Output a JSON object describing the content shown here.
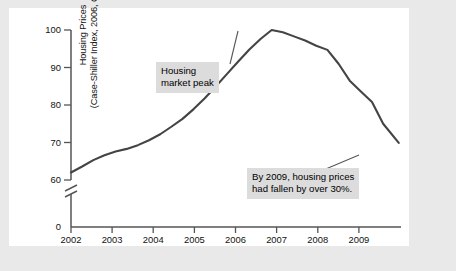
{
  "figure": {
    "background_color": "#ffffff",
    "outer_color": "#e9e9e9",
    "line_color": "#444444"
  },
  "chart_data": {
    "type": "line",
    "title": "",
    "xlabel": "",
    "ylabel": "Housing Prices (Case-Shiller Index, 2006, Q2 = 100)",
    "ylabel_lines": [
      "Housing Prices",
      "(Case-Shiller Index, 2006, Q2 = 100)"
    ],
    "xlim": [
      2002,
      2009.4
    ],
    "ylim": [
      58,
      102
    ],
    "yticks": [
      60,
      70,
      80,
      90,
      100
    ],
    "ytick_labels": [
      "60",
      "70",
      "80",
      "90",
      "100"
    ],
    "y_origin_label": "0",
    "axis_break": true,
    "xticks": [
      2002,
      2003,
      2004,
      2005,
      2006,
      2007,
      2008,
      2009
    ],
    "xtick_labels": [
      "2002",
      "2003",
      "2004",
      "2005",
      "2006",
      "2007",
      "2008",
      "2009"
    ],
    "grid": false,
    "legend": false,
    "series": [
      {
        "name": "Case-Shiller Home Price Index",
        "x": [
          2002.0,
          2002.25,
          2002.5,
          2002.75,
          2003.0,
          2003.25,
          2003.5,
          2003.75,
          2004.0,
          2004.25,
          2004.5,
          2004.75,
          2005.0,
          2005.25,
          2005.5,
          2005.75,
          2006.0,
          2006.25,
          2006.5,
          2006.75,
          2007.0,
          2007.25,
          2007.5,
          2007.75,
          2008.0,
          2008.25,
          2008.5,
          2008.75,
          2009.0,
          2009.35
        ],
        "values": [
          62.0,
          63.6,
          65.3,
          66.6,
          67.6,
          68.3,
          69.3,
          70.6,
          72.2,
          74.2,
          76.3,
          78.9,
          81.8,
          85.0,
          88.3,
          91.6,
          94.8,
          97.6,
          100.0,
          99.4,
          98.3,
          97.2,
          95.8,
          94.7,
          91.0,
          86.5,
          83.6,
          80.8,
          75.0,
          69.9
        ]
      }
    ],
    "annotations": [
      {
        "id": "housing-market-peak",
        "text": "Housing\nmarket peak",
        "target_x": 2006.25,
        "target_y": 100.0
      },
      {
        "id": "price-decline",
        "text": "By 2009, housing prices\nhad fallen by over 30%.",
        "target_x": 2009.0,
        "target_y": 68.4
      }
    ]
  }
}
